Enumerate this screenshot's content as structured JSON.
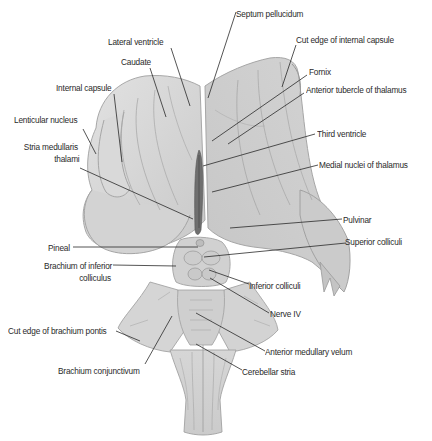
{
  "figure": {
    "type": "anatomical-diagram",
    "colors": {
      "background": "#ffffff",
      "tissue_light": "#dcdcdc",
      "tissue_mid": "#cfcfcf",
      "tissue_dark": "#b8b8b8",
      "outline": "#9a9a9a",
      "leader_line": "#2a2a2a",
      "text": "#2a2a2a"
    }
  },
  "labels": {
    "septum_pellucidum": "Septum pellucidum",
    "lateral_ventricle": "Lateral ventricle",
    "cut_edge_internal_capsule": "Cut edge of internal capsule",
    "caudate": "Caudate",
    "fornix": "Fornix",
    "internal_capsule": "Internal capsule",
    "anterior_tubercle_thalamus": "Anterior tubercle of thalamus",
    "lenticular_nucleus": "Lenticular nucleus",
    "third_ventricle": "Third ventricle",
    "stria_medullaris_1": "Stria medullaris",
    "stria_medullaris_2": "thalami",
    "medial_nuclei_thalamus": "Medial nuclei of thalamus",
    "pulvinar": "Pulvinar",
    "pineal": "Pineal",
    "superior_colliculi": "Superior colliculi",
    "brachium_inferior_colliculus_1": "Brachium of inferior",
    "brachium_inferior_colliculus_2": "colliculus",
    "inferior_colliculi": "Inferior colliculi",
    "nerve_iv": "Nerve IV",
    "cut_edge_brachium_pontis": "Cut edge of brachium pontis",
    "anterior_medullary_velum": "Anterior medullary velum",
    "brachium_conjunctivum": "Brachium conjunctivum",
    "cerebellar_stria": "Cerebellar stria"
  }
}
